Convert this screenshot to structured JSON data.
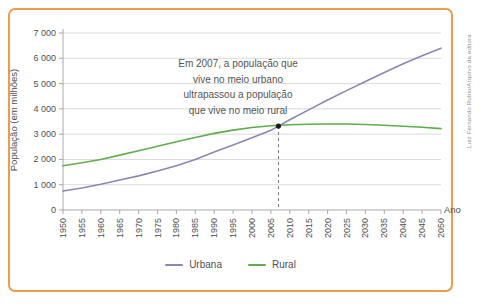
{
  "credit": "Luiz Fernando Rubio/Arquivo da editora",
  "colors": {
    "frame_border": "#EC9C50",
    "urbana": "#8C87B2",
    "rural": "#5FAD4F",
    "grid": "#DBDBDB",
    "axis": "#A9A9A9",
    "tick_text": "#4F4F4F",
    "annotation_text": "#555555",
    "dashed_line": "#777777",
    "marker_dot": "#1C1C1C"
  },
  "chart_data": {
    "type": "line",
    "x": [
      1950,
      1955,
      1960,
      1965,
      1970,
      1975,
      1980,
      1985,
      1990,
      1995,
      2000,
      2005,
      2010,
      2015,
      2020,
      2025,
      2030,
      2035,
      2040,
      2045,
      2050
    ],
    "series": [
      {
        "name": "Urbana",
        "color": "#8C87B2",
        "values": [
          750,
          870,
          1020,
          1190,
          1350,
          1540,
          1750,
          2000,
          2290,
          2570,
          2860,
          3150,
          3570,
          3960,
          4350,
          4720,
          5080,
          5440,
          5780,
          6100,
          6400
        ]
      },
      {
        "name": "Rural",
        "color": "#5FAD4F",
        "values": [
          1750,
          1870,
          2000,
          2170,
          2340,
          2520,
          2700,
          2870,
          3030,
          3160,
          3260,
          3330,
          3370,
          3390,
          3400,
          3400,
          3380,
          3350,
          3310,
          3270,
          3220
        ]
      }
    ],
    "title": "",
    "xlabel": "Ano",
    "ylabel": "População (em milhões)",
    "ylim": [
      0,
      7000
    ],
    "ytick_step": 1000,
    "ytick_labels": [
      "0",
      "1 000",
      "2 000",
      "3 000",
      "4 000",
      "5 000",
      "6 000",
      "7 000"
    ],
    "grid": true,
    "legend_position": "bottom",
    "annotation": {
      "text_lines": [
        "Em 2007, a população que",
        "vive no meio urbano",
        "ultrapassou a população",
        "que vive no meio rural"
      ],
      "marker_year": 2007,
      "marker_value": 3320
    }
  },
  "legend": {
    "items": [
      {
        "label": "Urbana"
      },
      {
        "label": "Rural"
      }
    ]
  }
}
